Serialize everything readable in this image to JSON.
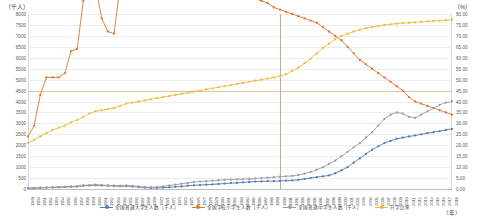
{
  "axes": {
    "left_unit": "（千人）",
    "right_unit": "（%）",
    "bottom_unit": "（年）",
    "left_ticks": [
      "8000",
      "7500",
      "7000",
      "6500",
      "6000",
      "5500",
      "5000",
      "4500",
      "4000",
      "3500",
      "3000",
      "2500",
      "2000",
      "1500",
      "1000",
      "500",
      "0"
    ],
    "right_ticks": [
      "80.00",
      "75.00",
      "70.00",
      "65.00",
      "60.00",
      "55.00",
      "50.00",
      "45.00",
      "40.00",
      "35.00",
      "30.00",
      "25.00",
      "20.00",
      "15.00",
      "10.00",
      "5.00",
      "0.00"
    ],
    "x_ticks": [
      "1949",
      "1950",
      "1951",
      "1952",
      "1953",
      "1954",
      "1955",
      "1956",
      "1957",
      "1958",
      "1959",
      "1960",
      "1961",
      "1962",
      "1963",
      "1964",
      "1965",
      "1966",
      "1967",
      "1968",
      "1969",
      "1970",
      "1971",
      "1972",
      "1973",
      "1974",
      "1975",
      "1976",
      "1977",
      "1978",
      "1979",
      "1980",
      "1981",
      "1982",
      "1983",
      "1984",
      "1985",
      "1986",
      "1987",
      "1988",
      "1989",
      "1990",
      "1991",
      "1992",
      "1993",
      "1994",
      "1995",
      "1996",
      "1997",
      "1998",
      "1999",
      "2000",
      "2001",
      "2002",
      "2003",
      "2004",
      "2005",
      "2006",
      "2007",
      "2008",
      "2009",
      "2010",
      "2011",
      "2012",
      "2013",
      "2014",
      "2015",
      "2016",
      "2017",
      "2018"
    ]
  },
  "legend": {
    "items": [
      {
        "label": "全国普通大学生人数（千人）",
        "color": "#4f7cb5",
        "marker": "circle"
      },
      {
        "label": "全国学校小学生人数（千人）",
        "color": "#e0752d",
        "marker": "circle"
      },
      {
        "label": "全国普通中学生人数（千人）",
        "color": "#9d9d9d",
        "marker": "circle"
      },
      {
        "label": "升学比率",
        "color": "#f2ba3c",
        "marker": "circle"
      }
    ]
  },
  "colors": {
    "blue": "#4f7cb5",
    "orange": "#e0752d",
    "gray": "#9d9d9d",
    "yellow": "#f2ba3c",
    "grid": "#ececec",
    "axis": "#bdbdbd",
    "vline": "#c9a98c",
    "hline": "#e0c29f"
  },
  "chart_data": {
    "type": "line",
    "title": "",
    "xlabel": "（年）",
    "ylabel": "（千人）",
    "ylabel_right": "（%）",
    "ylim": [
      0,
      8000
    ],
    "ylim_right": [
      0,
      80
    ],
    "grid": true,
    "legend_position": "bottom",
    "x": [
      "1949",
      "1950",
      "1951",
      "1952",
      "1953",
      "1954",
      "1955",
      "1956",
      "1957",
      "1958",
      "1959",
      "1960",
      "1961",
      "1962",
      "1963",
      "1964",
      "1965",
      "1966",
      "1967",
      "1968",
      "1969",
      "1970",
      "1971",
      "1972",
      "1973",
      "1974",
      "1975",
      "1976",
      "1977",
      "1978",
      "1979",
      "1980",
      "1981",
      "1982",
      "1983",
      "1984",
      "1985",
      "1986",
      "1987",
      "1988",
      "1989",
      "1990",
      "1991",
      "1992",
      "1993",
      "1994",
      "1995",
      "1996",
      "1997",
      "1998",
      "1999",
      "2000",
      "2001",
      "2002",
      "2003",
      "2004",
      "2005",
      "2006",
      "2007",
      "2008",
      "2009",
      "2010",
      "2011",
      "2012",
      "2013",
      "2014",
      "2015",
      "2016",
      "2017",
      "2018"
    ],
    "reference_line_x": "1990",
    "reference_line_y_right": 45.0,
    "series": [
      {
        "name": "全国普通大学生人数（千人）",
        "axis": "left",
        "color": "#4f7cb5",
        "values": [
          30,
          40,
          50,
          60,
          70,
          80,
          90,
          100,
          110,
          150,
          160,
          170,
          160,
          150,
          140,
          130,
          130,
          110,
          90,
          60,
          50,
          50,
          60,
          80,
          100,
          120,
          150,
          170,
          180,
          200,
          210,
          230,
          250,
          270,
          280,
          300,
          320,
          340,
          350,
          360,
          360,
          370,
          380,
          390,
          420,
          460,
          500,
          540,
          580,
          620,
          720,
          850,
          1000,
          1200,
          1400,
          1600,
          1800,
          1950,
          2100,
          2200,
          2300,
          2350,
          2400,
          2450,
          2500,
          2550,
          2600,
          2650,
          2700,
          2750
        ]
      },
      {
        "name": "全国学校小学生人数（千人）",
        "axis": "left",
        "color": "#e0752d",
        "values": [
          2400,
          2900,
          4300,
          5100,
          5100,
          5100,
          5300,
          6300,
          6400,
          8600,
          9000,
          9300,
          7800,
          7200,
          7100,
          9300,
          11600,
          11000,
          11000,
          11500,
          11600,
          11500,
          11200,
          11000,
          11200,
          11300,
          11100,
          11100,
          10900,
          10900,
          10600,
          10100,
          9900,
          9600,
          9200,
          8800,
          8700,
          8700,
          8600,
          8500,
          8300,
          8200,
          8100,
          8000,
          7900,
          7800,
          7700,
          7600,
          7400,
          7200,
          7000,
          6800,
          6500,
          6200,
          5900,
          5700,
          5500,
          5300,
          5100,
          4900,
          4700,
          4500,
          4200,
          4000,
          3900,
          3800,
          3700,
          3600,
          3500,
          3400
        ]
      },
      {
        "name": "全国普通中学生人数（千人）",
        "axis": "left",
        "color": "#9d9d9d",
        "values": [
          40,
          50,
          60,
          70,
          80,
          90,
          100,
          120,
          130,
          160,
          180,
          200,
          180,
          160,
          150,
          150,
          160,
          140,
          120,
          90,
          80,
          90,
          120,
          160,
          200,
          240,
          280,
          320,
          340,
          360,
          380,
          400,
          420,
          430,
          440,
          450,
          460,
          480,
          500,
          520,
          540,
          560,
          580,
          600,
          640,
          700,
          780,
          880,
          1000,
          1150,
          1300,
          1500,
          1700,
          1900,
          2100,
          2350,
          2600,
          2900,
          3200,
          3400,
          3500,
          3450,
          3300,
          3250,
          3400,
          3550,
          3700,
          3850,
          3950,
          4000
        ]
      },
      {
        "name": "升学比率",
        "axis": "right",
        "color": "#f2ba3c",
        "values": [
          21.0,
          22.5,
          24.0,
          25.5,
          27.0,
          28.0,
          29.0,
          30.5,
          31.5,
          33.0,
          34.5,
          35.5,
          36.0,
          36.5,
          37.0,
          38.0,
          39.0,
          39.5,
          40.0,
          40.5,
          41.0,
          41.5,
          42.0,
          42.5,
          43.0,
          43.5,
          44.0,
          44.5,
          45.0,
          45.5,
          46.0,
          46.5,
          47.0,
          47.5,
          48.0,
          48.5,
          49.0,
          49.5,
          50.0,
          50.5,
          51.0,
          51.5,
          52.5,
          54.0,
          55.5,
          57.5,
          59.5,
          62.0,
          64.5,
          66.5,
          68.5,
          70.0,
          71.0,
          72.0,
          72.8,
          73.5,
          74.0,
          74.5,
          75.0,
          75.3,
          75.6,
          75.8,
          76.0,
          76.2,
          76.4,
          76.6,
          76.8,
          77.0,
          77.2,
          77.4
        ]
      }
    ]
  }
}
